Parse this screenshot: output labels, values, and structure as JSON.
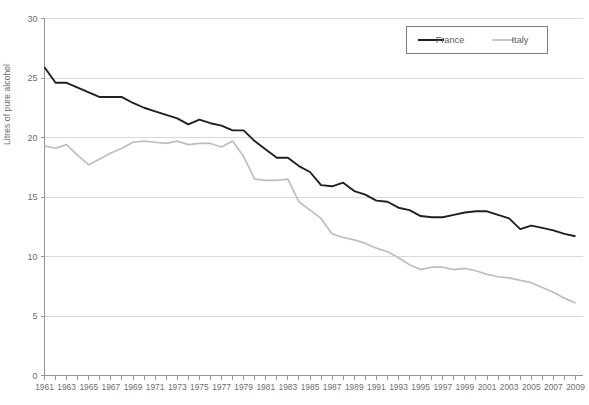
{
  "chart_data": {
    "type": "line",
    "title": "",
    "subtitle": "",
    "xlabel": "",
    "ylabel": "Litres of pure alcohol",
    "xlim": [
      1961,
      2009
    ],
    "ylim": [
      0,
      30
    ],
    "yticks": [
      0,
      5,
      10,
      15,
      20,
      25,
      30
    ],
    "ytick_labels": [
      "0",
      "5",
      "10",
      "15",
      "20",
      "25",
      "30"
    ],
    "grid": true,
    "grid_axis": "y",
    "legend_position": "top-right",
    "x": [
      1961,
      1962,
      1963,
      1964,
      1965,
      1966,
      1967,
      1968,
      1969,
      1970,
      1971,
      1972,
      1973,
      1974,
      1975,
      1976,
      1977,
      1978,
      1979,
      1980,
      1981,
      1982,
      1983,
      1984,
      1985,
      1986,
      1987,
      1988,
      1989,
      1990,
      1991,
      1992,
      1993,
      1994,
      1995,
      1996,
      1997,
      1998,
      1999,
      2000,
      2001,
      2002,
      2003,
      2004,
      2005,
      2006,
      2007,
      2008,
      2009
    ],
    "xtick_labels": [
      "1961",
      "1963",
      "1965",
      "1967",
      "1969",
      "1971",
      "1973",
      "1975",
      "1977",
      "1979",
      "1981",
      "1983",
      "1985",
      "1987",
      "1989",
      "1991",
      "1993",
      "1995",
      "1997",
      "1999",
      "2001",
      "2003",
      "2005",
      "2007",
      "2009"
    ],
    "series": [
      {
        "name": "France",
        "color": "#231f20",
        "values": [
          25.9,
          24.6,
          24.6,
          24.2,
          23.8,
          23.4,
          23.4,
          23.4,
          22.9,
          22.5,
          22.2,
          21.9,
          21.6,
          21.1,
          21.5,
          21.2,
          21.0,
          20.6,
          20.6,
          19.7,
          19.0,
          18.3,
          18.3,
          17.6,
          17.1,
          16.0,
          15.9,
          16.2,
          15.5,
          15.2,
          14.7,
          14.6,
          14.1,
          13.9,
          13.4,
          13.3,
          13.3,
          13.5,
          13.7,
          13.8,
          13.8,
          13.5,
          13.2,
          12.3,
          12.6,
          12.4,
          12.2,
          11.9,
          11.7
        ]
      },
      {
        "name": "Italy",
        "color": "#bcbec0",
        "values": [
          19.3,
          19.1,
          19.4,
          18.5,
          17.7,
          18.2,
          18.7,
          19.1,
          19.6,
          19.7,
          19.6,
          19.5,
          19.7,
          19.4,
          19.5,
          19.5,
          19.2,
          19.7,
          18.4,
          16.5,
          16.4,
          16.4,
          16.5,
          14.6,
          13.9,
          13.2,
          11.9,
          11.6,
          11.4,
          11.1,
          10.7,
          10.4,
          9.9,
          9.3,
          8.9,
          9.1,
          9.1,
          8.9,
          9.0,
          8.8,
          8.5,
          8.3,
          8.2,
          8.0,
          7.8,
          7.4,
          7.0,
          6.5,
          6.1
        ]
      }
    ]
  },
  "legend": {
    "entries": [
      {
        "label": "France",
        "color": "#231f20"
      },
      {
        "label": "Italy",
        "color": "#bcbec0"
      }
    ]
  },
  "axes": {
    "y_title": "Litres of pure alcohol"
  }
}
